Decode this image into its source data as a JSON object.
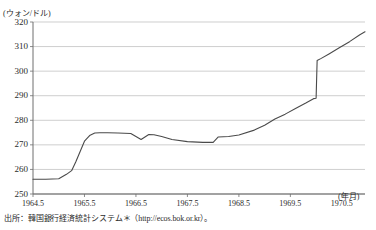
{
  "page": {
    "top_partial_row": {
      "t1": "",
      "t2": "",
      "t3": "",
      "t4": ""
    },
    "source_note": "出所：韓国銀行経済統計システム＊（http://ecos.bok.or.kr）。"
  },
  "chart_data": {
    "type": "line",
    "title": "",
    "xlabel": "(年月)",
    "ylabel": "(ウォン/ドル)",
    "ylim": [
      250,
      320
    ],
    "xlim": [
      1964.5,
      1970.95
    ],
    "yticks": [
      250,
      260,
      270,
      280,
      290,
      300,
      310,
      320
    ],
    "ytick_labels": [
      "250",
      "260",
      "270",
      "280",
      "290",
      "300",
      "310",
      "320"
    ],
    "xticks": [
      1964.5,
      1965.5,
      1966.5,
      1967.5,
      1968.5,
      1969.5,
      1970.5
    ],
    "xtick_labels": [
      "1964.5",
      "1965.5",
      "1966.5",
      "1967.5",
      "1968.5",
      "1969.5",
      "1970.5"
    ],
    "grid": "horizontal",
    "legend": "none",
    "line_color": "#4a4a4a",
    "series": [
      {
        "name": "ウォン/ドル為替レート",
        "x": [
          1964.5,
          1964.75,
          1965.0,
          1965.15,
          1965.25,
          1965.33,
          1965.42,
          1965.5,
          1965.6,
          1965.7,
          1965.8,
          1965.95,
          1966.15,
          1966.4,
          1966.6,
          1966.75,
          1966.85,
          1967.0,
          1967.2,
          1967.5,
          1967.8,
          1968.0,
          1968.1,
          1968.2,
          1968.3,
          1968.5,
          1968.8,
          1969.0,
          1969.2,
          1969.4,
          1969.6,
          1969.8,
          1969.95,
          1970.0,
          1970.02,
          1970.1,
          1970.25,
          1970.45,
          1970.65,
          1970.85,
          1970.95
        ],
        "y": [
          256.0,
          256.0,
          256.2,
          258.0,
          259.5,
          263.0,
          267.5,
          271.5,
          273.8,
          274.8,
          274.9,
          274.9,
          274.8,
          274.6,
          272.2,
          274.2,
          274.1,
          273.4,
          272.2,
          271.3,
          271.0,
          271.0,
          273.2,
          273.3,
          273.4,
          274.0,
          276.0,
          278.0,
          280.5,
          282.5,
          284.8,
          287.0,
          288.8,
          289.0,
          304.3,
          305.2,
          307.0,
          309.5,
          312.0,
          314.8,
          316.0
        ]
      }
    ],
    "annotations": [
      {
        "text": "急激な上昇（1965年）",
        "x": 1965.3,
        "y": 265
      },
      {
        "text": "切り下げによる垂直ジャンプ（1970年）",
        "x": 1970.0,
        "y": 296
      }
    ]
  }
}
